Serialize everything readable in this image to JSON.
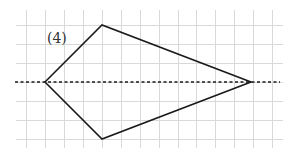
{
  "figure": {
    "label": "(4)",
    "label_position": {
      "x": 47,
      "y": 31
    },
    "grid": {
      "color": "#d9d9d9",
      "vertical_x": [
        26,
        45,
        64,
        83,
        102,
        121,
        140,
        159,
        178,
        196,
        215,
        234,
        253,
        272
      ],
      "horizontal_y": [
        25,
        44,
        63,
        82,
        101,
        120,
        139
      ],
      "x_extent": [
        16,
        283
      ],
      "y_extent": [
        10,
        148
      ]
    },
    "shape": {
      "type": "kite",
      "stroke_color": "#1a1a1a",
      "vertices": [
        {
          "name": "left",
          "x": 45,
          "y": 82
        },
        {
          "name": "top",
          "x": 102,
          "y": 25
        },
        {
          "name": "right",
          "x": 251,
          "y": 82
        },
        {
          "name": "bottom",
          "x": 102,
          "y": 139
        }
      ]
    },
    "axis_of_symmetry": {
      "style": "dashed",
      "x1": 15,
      "y1": 82,
      "x2": 280,
      "y2": 82
    }
  }
}
